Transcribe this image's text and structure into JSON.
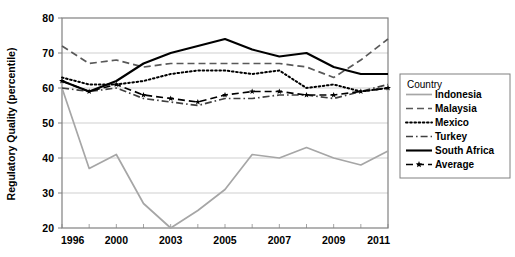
{
  "chart_data": {
    "type": "line",
    "title": "",
    "xlabel": "",
    "ylabel": "Regulatory Quality (percentile)",
    "x": [
      1996,
      1998,
      2000,
      2002,
      2003,
      2004,
      2005,
      2006,
      2007,
      2008,
      2009,
      2010,
      2011
    ],
    "xtick_labels": [
      "1996",
      "2000",
      "2003",
      "2005",
      "2007",
      "2009",
      "2011"
    ],
    "xtick_values": [
      1996,
      2000,
      2003,
      2005,
      2007,
      2009,
      2011
    ],
    "ytick_labels": [
      "20",
      "30",
      "40",
      "50",
      "60",
      "70",
      "80"
    ],
    "ytick_values": [
      20,
      30,
      40,
      50,
      60,
      70,
      80
    ],
    "xlim": [
      1996,
      2011
    ],
    "ylim": [
      20,
      80
    ],
    "grid": "horizontal",
    "legend_position": "right",
    "legend_title": "Country",
    "series": [
      {
        "name": "Indonesia",
        "style": "solid",
        "color": "#a6a6a6",
        "marker": "none",
        "values": [
          60,
          37,
          41,
          27,
          20,
          25,
          31,
          41,
          40,
          43,
          40,
          38,
          42
        ]
      },
      {
        "name": "Malaysia",
        "style": "dashed",
        "color": "#595959",
        "marker": "none",
        "values": [
          72,
          67,
          68,
          66,
          67,
          67,
          67,
          67,
          67,
          66,
          63,
          68,
          74
        ]
      },
      {
        "name": "Mexico",
        "style": "dotted",
        "color": "#000000",
        "marker": "none",
        "values": [
          63,
          61,
          61,
          62,
          64,
          65,
          65,
          64,
          65,
          60,
          61,
          59,
          60
        ]
      },
      {
        "name": "Turkey",
        "style": "dashdot",
        "color": "#404040",
        "marker": "none",
        "values": [
          60,
          59,
          60,
          57,
          56,
          55,
          57,
          57,
          58,
          58,
          57,
          59,
          61
        ]
      },
      {
        "name": "South Africa",
        "style": "solid",
        "color": "#000000",
        "marker": "none",
        "values": [
          62,
          59,
          62,
          67,
          70,
          72,
          74,
          71,
          69,
          70,
          66,
          64,
          64
        ]
      },
      {
        "name": "Average",
        "style": "dashed",
        "color": "#000000",
        "marker": "star",
        "values": [
          62,
          59,
          61,
          58,
          57,
          56,
          58,
          59,
          59,
          58,
          58,
          59,
          60
        ]
      }
    ]
  },
  "legend": {
    "title": "Country",
    "items": [
      {
        "label": "Indonesia"
      },
      {
        "label": "Malaysia"
      },
      {
        "label": "Mexico"
      },
      {
        "label": "Turkey"
      },
      {
        "label": "South Africa"
      },
      {
        "label": "Average"
      }
    ]
  },
  "axes": {
    "y_title": "Regulatory Quality (percentile)"
  }
}
